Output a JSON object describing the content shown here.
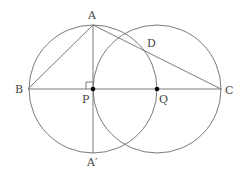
{
  "diagram": {
    "points": {
      "A": {
        "label": "A",
        "x": 93,
        "y": 25
      },
      "B": {
        "label": "B",
        "x": 28,
        "y": 89
      },
      "C": {
        "label": "C",
        "x": 221,
        "y": 89
      },
      "D": {
        "label": "D",
        "x": 145,
        "y": 51
      },
      "P": {
        "label": "P",
        "x": 93,
        "y": 89
      },
      "Q": {
        "label": "Q",
        "x": 157,
        "y": 89
      },
      "A2": {
        "label": "A′",
        "x": 93,
        "y": 153
      }
    },
    "circles": [
      {
        "name": "circle-centered-P",
        "cx": 93,
        "cy": 89,
        "r": 64
      },
      {
        "name": "circle-centered-Q",
        "cx": 157,
        "cy": 89,
        "r": 64
      }
    ],
    "segments": [
      "AB",
      "AC",
      "BC",
      "AA′"
    ],
    "right_angle_at": "P",
    "marked_points": [
      "P",
      "Q"
    ],
    "colors": {
      "line": "#6b6b6b",
      "text": "#444444",
      "dot": "#000000"
    }
  }
}
